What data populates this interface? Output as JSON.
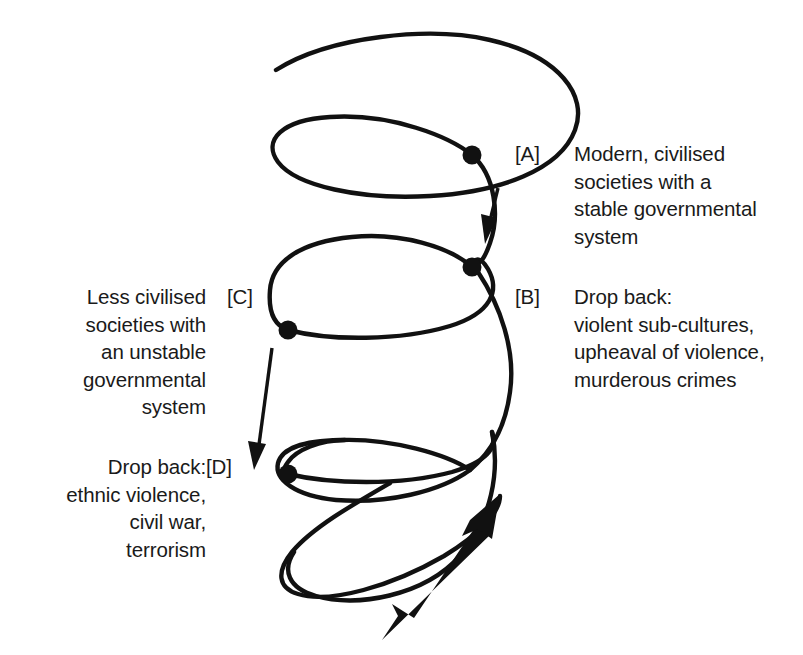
{
  "diagram": {
    "background_color": "#ffffff",
    "stroke_color": "#111111",
    "markers": [
      {
        "id": "A",
        "label": "[A]",
        "text": "Modern, civilised\nsocieties with a\nstable governmental\nsystem",
        "side": "right",
        "dot": {
          "x": 472,
          "y": 155
        }
      },
      {
        "id": "B",
        "label": "[B]",
        "text": "Drop back:\nviolent sub-cultures,\nupheaval of violence,\nmurderous crimes",
        "side": "right",
        "dot": {
          "x": 472,
          "y": 267
        }
      },
      {
        "id": "C",
        "label": "[C]",
        "text": "Less civilised\nsocieties with\nan unstable\ngovernmental\nsystem",
        "side": "left",
        "dot": {
          "x": 288,
          "y": 330
        }
      },
      {
        "id": "D",
        "label": "[D]",
        "text": "Drop back:\nethnic violence,\ncivil war,\nterrorism",
        "side": "left",
        "dot": {
          "x": 288,
          "y": 474
        }
      }
    ],
    "icons": {
      "spiral": "spiral-curve",
      "arrow_a": "drop-back-arrow-a",
      "arrow_c": "drop-back-arrow-c",
      "arrow_progress": "upward-progress-arrow",
      "dot": "node-dot"
    }
  }
}
